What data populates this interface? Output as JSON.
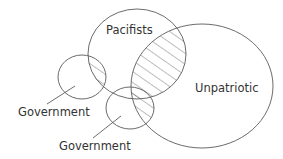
{
  "diagram": {
    "type": "euler-diagram",
    "colors": {
      "stroke": "#5a5a5a",
      "text": "#333333",
      "background": "#ffffff"
    },
    "sets": [
      {
        "id": "pacifists",
        "label": "Pacifists"
      },
      {
        "id": "unpatriotic",
        "label": "Unpatriotic"
      },
      {
        "id": "government-1",
        "label": "Government"
      },
      {
        "id": "government-2",
        "label": "Government"
      }
    ],
    "shaded_regions": [
      "pacifists ∩ government-1",
      "pacifists ∩ unpatriotic",
      "government-2 ∩ unpatriotic"
    ],
    "labels": {
      "pacifists": "Pacifists",
      "unpatriotic": "Unpatriotic",
      "government_left": "Government",
      "government_bottom": "Government"
    }
  }
}
